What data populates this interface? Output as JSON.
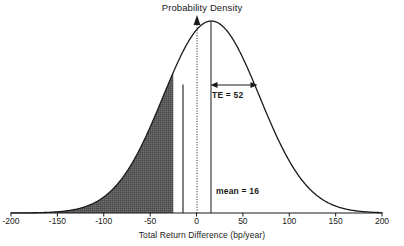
{
  "chart_data": {
    "type": "area",
    "title": "Probability Density",
    "xlabel": "Total Return Difference (bp/year)",
    "ylabel": "Probability Density",
    "xlim": [
      -200,
      200
    ],
    "ylim": [
      0,
      1
    ],
    "xticks": [
      -200,
      -150,
      -100,
      -50,
      0,
      50,
      100,
      150,
      200
    ],
    "xtick_labels": [
      "-200",
      "-150",
      "-100",
      "-50",
      "0",
      "50",
      "100",
      "150",
      "200"
    ],
    "yticks": [],
    "grid": false,
    "legend": false,
    "distribution": {
      "kind": "normal",
      "mean": 16,
      "std_dev": 52
    },
    "series": [
      {
        "name": "Probability density of total return difference",
        "x": [
          -200,
          -190,
          -180,
          -170,
          -160,
          -150,
          -140,
          -130,
          -120,
          -110,
          -100,
          -90,
          -80,
          -70,
          -60,
          -50,
          -40,
          -30,
          -20,
          -10,
          0,
          10,
          16,
          20,
          30,
          40,
          50,
          60,
          70,
          80,
          90,
          100,
          110,
          120,
          130,
          140,
          150,
          160,
          170,
          180,
          190,
          200
        ],
        "y": [
          0.002,
          0.004,
          0.007,
          0.013,
          0.022,
          0.036,
          0.057,
          0.087,
          0.127,
          0.18,
          0.245,
          0.322,
          0.408,
          0.499,
          0.592,
          0.681,
          0.761,
          0.828,
          0.9,
          0.954,
          0.988,
          1.0,
          1.0,
          0.997,
          0.977,
          0.935,
          0.875,
          0.801,
          0.717,
          0.628,
          0.538,
          0.452,
          0.372,
          0.3,
          0.237,
          0.184,
          0.14,
          0.104,
          0.076,
          0.055,
          0.038,
          0.026
        ]
      }
    ],
    "shaded_region": {
      "label": "Probability of underperformance (left tail)",
      "x_from": -200,
      "x_to": -25,
      "color": "#5a5a5a"
    },
    "vertical_lines": [
      {
        "name": "y-axis",
        "x": 0,
        "style": "dotted",
        "arrow_head": true
      },
      {
        "name": "mean-line",
        "x": 16,
        "style": "solid",
        "arrow_head": false
      },
      {
        "name": "shade-boundary",
        "x": -25,
        "style": "solid",
        "arrow_head": false
      }
    ],
    "annotations": [
      {
        "name": "tracking-error",
        "text": "TE = 52",
        "x_from": 16,
        "x_to": 68,
        "arrow": "double"
      },
      {
        "name": "mean",
        "text": "mean = 16",
        "x": 16
      }
    ]
  },
  "chart": {
    "title": "Probability Density",
    "xlabel": "Total Return Difference (bp/year)",
    "te_annotation": "TE = 52",
    "mean_annotation": "mean = 16",
    "ticks": [
      {
        "value": -200,
        "label": "-200"
      },
      {
        "value": -150,
        "label": "-150"
      },
      {
        "value": -100,
        "label": "-100"
      },
      {
        "value": -50,
        "label": "-50"
      },
      {
        "value": 0,
        "label": "0"
      },
      {
        "value": 50,
        "label": "50"
      },
      {
        "value": 100,
        "label": "100"
      },
      {
        "value": 150,
        "label": "150"
      },
      {
        "value": 200,
        "label": "200"
      }
    ],
    "colors": {
      "curve": "#1a1a1a",
      "shade": "#5a5a5a",
      "axis": "#1a1a1a",
      "text": "#1a1a1a",
      "background": "#ffffff"
    }
  }
}
